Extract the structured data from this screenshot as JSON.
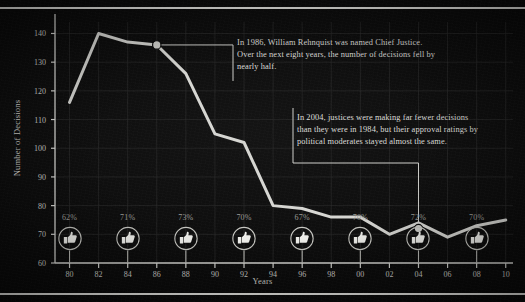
{
  "chart_data": {
    "type": "line",
    "title": "",
    "xlabel": "Years",
    "ylabel": "Number of Decisions",
    "xlim": [
      1979,
      2010.5
    ],
    "ylim": [
      60,
      144
    ],
    "grid": true,
    "legend": "none",
    "x_tick_labels": [
      "80",
      "82",
      "84",
      "86",
      "88",
      "90",
      "92",
      "94",
      "96",
      "98",
      "00",
      "02",
      "04",
      "06",
      "08",
      "10"
    ],
    "x_tick_values": [
      1980,
      1982,
      1984,
      1986,
      1988,
      1990,
      1992,
      1994,
      1996,
      1998,
      2000,
      2002,
      2004,
      2006,
      2008,
      2010
    ],
    "y_tick_labels": [
      "60",
      "70",
      "80",
      "90",
      "100",
      "110",
      "120",
      "130",
      "140"
    ],
    "y_tick_values": [
      60,
      70,
      80,
      90,
      100,
      110,
      120,
      130,
      140
    ],
    "series": [
      {
        "name": "Number of Decisions",
        "color": "#d6d6d2",
        "x": [
          1980,
          1982,
          1984,
          1986,
          1988,
          1990,
          1992,
          1994,
          1996,
          1998,
          2000,
          2002,
          2004,
          2006,
          2008,
          2010
        ],
        "values": [
          116,
          140,
          137,
          136,
          126,
          105,
          102,
          80,
          79,
          76,
          76,
          70,
          74,
          69,
          73,
          75
        ]
      }
    ],
    "markers": [
      {
        "name": "rehnquist-marker",
        "x": 1986,
        "y": 136,
        "label": ""
      },
      {
        "name": "approval-2004-marker",
        "x": 2004,
        "y": 72,
        "label": "72%",
        "units": "percent"
      }
    ],
    "approval_ratings": {
      "label": "approval ratings by political moderates",
      "icon": "thumbs-up-icon",
      "x_tick_labels": [
        "80",
        "84",
        "88",
        "92",
        "96",
        "00",
        "04",
        "08"
      ],
      "x_values": [
        1980,
        1984,
        1988,
        1992,
        1996,
        2000,
        2004,
        2008
      ],
      "values": [
        "62%",
        "71%",
        "73%",
        "70%",
        "67%",
        "70%",
        "72%",
        "70%"
      ]
    },
    "annotations": [
      {
        "name": "annotation-rehnquist",
        "text": "In 1986, William Rehnquist was named Chief Justice. Over the next eight years, the number of decisions fell by nearly half.",
        "anchor_x": 1986,
        "anchor_y": 136
      },
      {
        "name": "annotation-approval-2004",
        "text": "In 2004, justices were making far fewer decisions than they were in 1984, but their approval ratings by political moderates stayed almost the same.",
        "anchor_x": 2004,
        "anchor_y": 72
      }
    ],
    "colors": {
      "background": "#0b0b0b",
      "line": "#d6d6d2",
      "axis": "#d6d6d2",
      "grid": "#2a2a2a",
      "text": "#d8d8d4",
      "percent_text": "#9a9a95",
      "rule": "#e9e9e5"
    }
  }
}
